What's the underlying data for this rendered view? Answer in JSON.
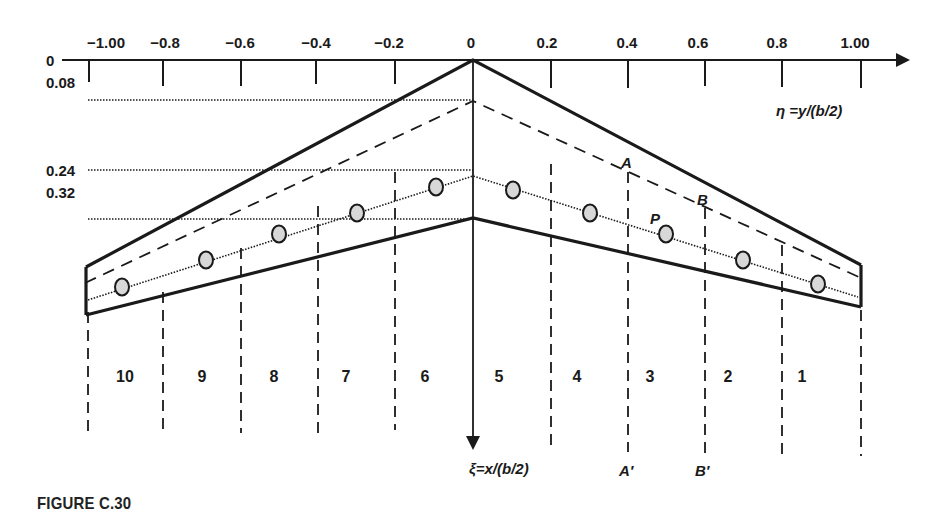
{
  "figure": {
    "caption": "FIGURE C.30"
  },
  "axes": {
    "eta_label": "η =y/(b/2)",
    "xi_label": "ξ=x/(b/2)",
    "eta_ticks": [
      {
        "label": "−1.00",
        "x": 88
      },
      {
        "label": "−0.8",
        "x": 163
      },
      {
        "label": "−0.6",
        "x": 241
      },
      {
        "label": "−0.4",
        "x": 316
      },
      {
        "label": "−0.2",
        "x": 395
      },
      {
        "label": "0",
        "x": 473
      },
      {
        "label": "0.2",
        "x": 551
      },
      {
        "label": "0.4",
        "x": 628
      },
      {
        "label": "0.6",
        "x": 705
      },
      {
        "label": "0.8",
        "x": 782
      },
      {
        "label": "1.00",
        "x": 861
      }
    ],
    "xi_ticks": [
      {
        "label": "0",
        "y": 60
      },
      {
        "label": "0.08",
        "y": 82
      },
      {
        "label": "0.24",
        "y": 170
      },
      {
        "label": "0.32",
        "y": 193
      }
    ]
  },
  "colors": {
    "line": "#1a1a1a",
    "point_fill": "#d8d8d8"
  },
  "wing": {
    "leading_edge": [
      [
        85,
        267
      ],
      [
        473,
        60
      ],
      [
        861,
        265
      ]
    ],
    "trailing_edge": [
      [
        85,
        315
      ],
      [
        473,
        218
      ],
      [
        861,
        307
      ]
    ],
    "quarter_chord": [
      [
        85,
        283
      ],
      [
        473,
        101
      ],
      [
        861,
        278
      ]
    ],
    "three_quarter_chord": [
      [
        85,
        300
      ],
      [
        473,
        176
      ],
      [
        861,
        297
      ]
    ],
    "ref_lines_y": [
      100,
      170,
      219
    ]
  },
  "strip_points": [
    {
      "strip": 10,
      "x": 122,
      "y": 287
    },
    {
      "strip": 9,
      "x": 206,
      "y": 260
    },
    {
      "strip": 8,
      "x": 279,
      "y": 234
    },
    {
      "strip": 7,
      "x": 357,
      "y": 213
    },
    {
      "strip": 6,
      "x": 436,
      "y": 187
    },
    {
      "strip": 5,
      "x": 513,
      "y": 190
    },
    {
      "strip": 4,
      "x": 590,
      "y": 213
    },
    {
      "strip": 3,
      "x": 666,
      "y": 234,
      "label": "P"
    },
    {
      "strip": 2,
      "x": 743,
      "y": 260
    },
    {
      "strip": 1,
      "x": 818,
      "y": 284
    }
  ],
  "strips": [
    {
      "label": "10",
      "x": 124
    },
    {
      "label": "9",
      "x": 202
    },
    {
      "label": "8",
      "x": 274
    },
    {
      "label": "7",
      "x": 346
    },
    {
      "label": "6",
      "x": 425
    },
    {
      "label": "5",
      "x": 499
    },
    {
      "label": "4",
      "x": 577
    },
    {
      "label": "3",
      "x": 650
    },
    {
      "label": "2",
      "x": 728
    },
    {
      "label": "1",
      "x": 803
    }
  ],
  "markers": {
    "A": {
      "label": "A",
      "x": 624,
      "y": 168
    },
    "B": {
      "label": "B",
      "x": 697,
      "y": 206
    },
    "P": {
      "label": "P",
      "x": 650,
      "y": 222
    },
    "A_prime": {
      "label": "A′",
      "x": 622,
      "y": 473
    },
    "B_prime": {
      "label": "B′",
      "x": 697,
      "y": 473
    }
  }
}
